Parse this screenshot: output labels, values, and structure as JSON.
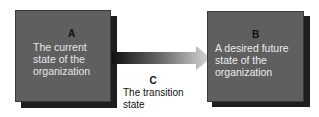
{
  "diagram": {
    "type": "process-flow",
    "box_a": {
      "letter": "A",
      "text": "The current state of the organization"
    },
    "box_b": {
      "letter": "B",
      "text": "A desired future state of the organization"
    },
    "transition": {
      "letter": "C",
      "text": "The transition state"
    },
    "colors": {
      "box_fill": "#5f5f5f",
      "shadow": "#1e1e1e",
      "arrow_start": "#111111",
      "arrow_end": "#d9d9d9"
    }
  }
}
